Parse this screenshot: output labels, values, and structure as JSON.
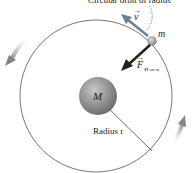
{
  "diagram": {
    "top_caption": "Circular orbit of radius",
    "mass_small_label": "m",
    "mass_large_label": "M",
    "velocity_label": "v",
    "force_label": "F",
    "force_subscript": "M on m",
    "radius_label": "Radius r",
    "colors": {
      "orbit": "#555555",
      "planet": "#8a8a8a",
      "satellite": "#999999",
      "force_arrow": "#222222",
      "velocity_arrow": "#6a7f95",
      "rotation_arrows": "#8a9098"
    }
  }
}
